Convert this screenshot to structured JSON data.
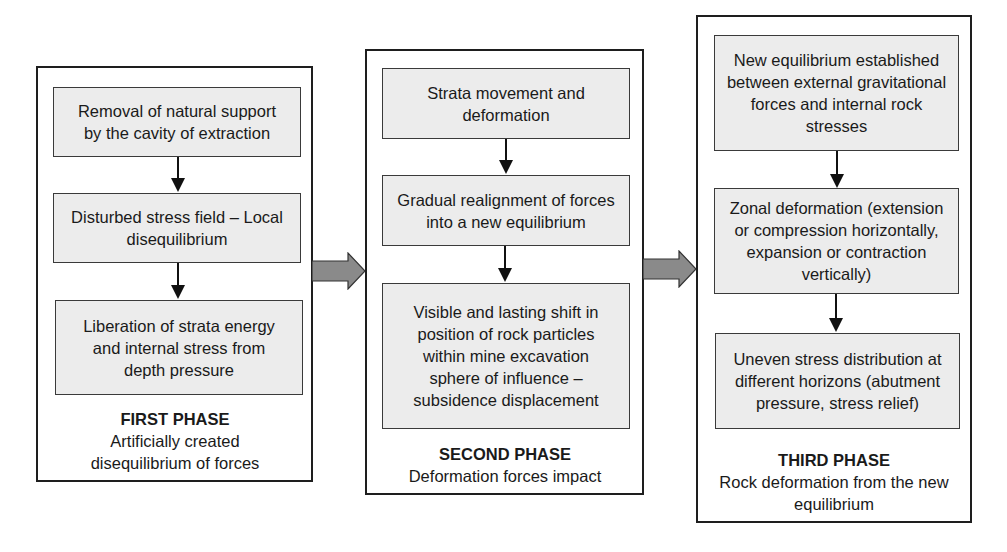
{
  "diagram": {
    "phases": [
      {
        "title": "FIRST PHASE",
        "subtitle": "Artificially created disequilibrium of forces",
        "steps": [
          "Removal of natural support by the cavity of extraction",
          "Disturbed stress field – Local disequilibrium",
          "Liberation of strata energy and internal stress from depth pressure"
        ]
      },
      {
        "title": "SECOND PHASE",
        "subtitle": "Deformation forces impact",
        "steps": [
          "Strata movement and deformation",
          "Gradual realignment of forces into a new equilibrium",
          "Visible and lasting shift in position of rock particles within mine excavation sphere of influence – subsidence displacement"
        ]
      },
      {
        "title": "THIRD PHASE",
        "subtitle": "Rock deformation from the new equilibrium",
        "steps": [
          "New equilibrium established between external gravitational forces and internal rock stresses",
          "Zonal deformation (extension or compression horizontally, expansion or contraction vertically)",
          "Uneven stress distribution at different horizons (abutment pressure, stress relief)"
        ]
      }
    ],
    "connectors": [
      {
        "from": "FIRST PHASE",
        "to": "SECOND PHASE",
        "icon": "right-arrow-icon"
      },
      {
        "from": "SECOND PHASE",
        "to": "THIRD PHASE",
        "icon": "right-arrow-icon"
      }
    ],
    "colors": {
      "box_fill": "#ececec",
      "border": "#1e1e1e",
      "arrow_fill": "#8a8a8a"
    }
  }
}
